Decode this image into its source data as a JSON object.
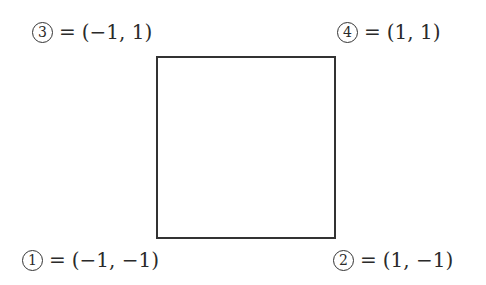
{
  "diagram": {
    "shape": "square",
    "stroke_color": "#333333",
    "corners": [
      {
        "id": "1",
        "index_glyph": "1",
        "equals": "=",
        "coords": "(−1, −1)",
        "position": "bottom-left"
      },
      {
        "id": "2",
        "index_glyph": "2",
        "equals": "=",
        "coords": "(1, −1)",
        "position": "bottom-right"
      },
      {
        "id": "3",
        "index_glyph": "3",
        "equals": "=",
        "coords": "(−1, 1)",
        "position": "top-left"
      },
      {
        "id": "4",
        "index_glyph": "4",
        "equals": "=",
        "coords": "(1, 1)",
        "position": "top-right"
      }
    ]
  }
}
